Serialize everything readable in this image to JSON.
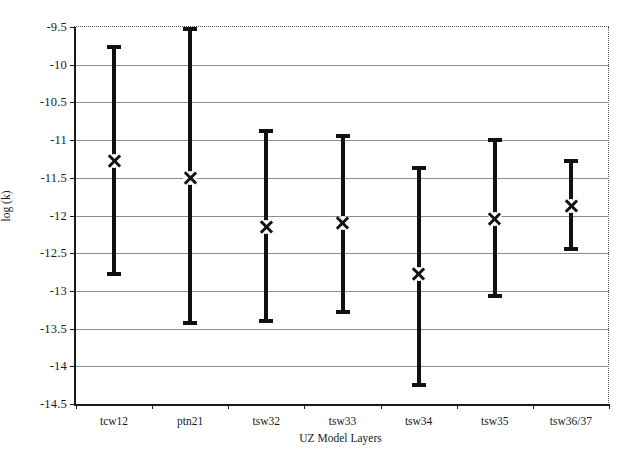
{
  "chart_data": {
    "type": "scatter",
    "title": "",
    "xlabel": "UZ Model Layers",
    "ylabel": "log (k)",
    "categories": [
      "tcw12",
      "ptn21",
      "tsw32",
      "tsw33",
      "tsw34",
      "tsw35",
      "tsw36/37"
    ],
    "ylim": [
      -14.5,
      -9.5
    ],
    "yticks": [
      -9.5,
      -10,
      -10.5,
      -11,
      -11.5,
      -12,
      -12.5,
      -13,
      -13.5,
      -14,
      -14.5
    ],
    "ytick_labels": [
      "-9.5",
      "-10",
      "-10.5",
      "-11",
      "-11.5",
      "-12",
      "-12.5",
      "-13",
      "-13.5",
      "-14",
      "-14.5"
    ],
    "grid": true,
    "legend": "none",
    "marker": "x",
    "series": [
      {
        "name": "log (k)",
        "values": [
          -11.28,
          -11.5,
          -12.15,
          -12.1,
          -12.78,
          -12.05,
          -11.87
        ],
        "upper": [
          -9.74,
          -9.5,
          -10.85,
          -10.92,
          -11.35,
          -10.97,
          -11.25
        ],
        "lower": [
          -12.8,
          -13.45,
          -13.43,
          -13.3,
          -14.27,
          -13.1,
          -12.47
        ]
      }
    ],
    "colors": {
      "bar": "#111111",
      "grid": "#8c8c8c",
      "axis": "#1a1a1a",
      "background": "#ffffff"
    }
  }
}
